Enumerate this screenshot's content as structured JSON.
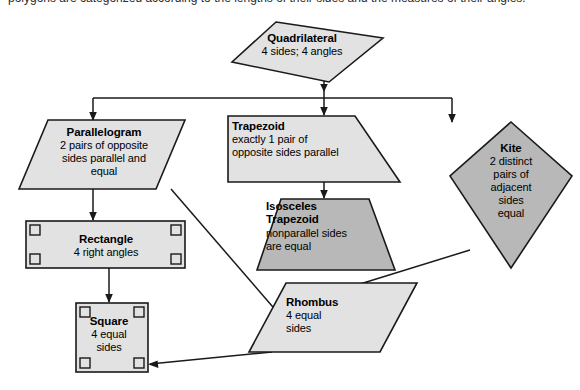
{
  "diagram": {
    "type": "hierarchy-flowchart",
    "title_strip_text": "polygons are categorized according to the lengths of their sides and the measures of their angles.",
    "colors": {
      "fill_light": "#e2e2e2",
      "fill_dark": "#b8b8b8",
      "stroke": "#1a1a1a",
      "background": "#ffffff",
      "text": "#000000"
    },
    "nodes": [
      {
        "id": "quadrilateral",
        "shape": "irregular-quadrilateral",
        "fill": "light",
        "title": "Quadrilateral",
        "sub_lines": [
          "4 sides; 4 angles"
        ]
      },
      {
        "id": "parallelogram",
        "shape": "parallelogram",
        "fill": "light",
        "title": "Parallelogram",
        "sub_lines": [
          "2 pairs of opposite",
          "sides parallel and",
          "equal"
        ]
      },
      {
        "id": "trapezoid",
        "shape": "right-trapezoid",
        "fill": "light",
        "title": "Trapezoid",
        "sub_lines": [
          "exactly 1 pair of",
          "opposite sides parallel"
        ]
      },
      {
        "id": "kite",
        "shape": "kite",
        "fill": "dark",
        "title": "Kite",
        "sub_lines": [
          "2 distinct",
          "pairs of",
          "adjacent",
          "sides",
          "equal"
        ]
      },
      {
        "id": "isosceles-trapezoid",
        "shape": "isosceles-trapezoid",
        "fill": "dark",
        "title": "Isosceles",
        "title2": "Trapezoid",
        "sub_lines": [
          "nonparallel sides",
          "are equal"
        ]
      },
      {
        "id": "rectangle",
        "shape": "rectangle",
        "fill": "light",
        "title": "Rectangle",
        "sub_lines": [
          "4 right angles"
        ],
        "right_angle_marks": 4
      },
      {
        "id": "rhombus",
        "shape": "rhombus",
        "fill": "light",
        "title": "Rhombus",
        "sub_lines": [
          "4 equal",
          "sides"
        ]
      },
      {
        "id": "square",
        "shape": "square",
        "fill": "light",
        "title": "Square",
        "sub_lines": [
          "4 equal",
          "sides"
        ],
        "right_angle_marks": 4
      }
    ],
    "edges": [
      {
        "from": "quadrilateral",
        "to": "bus"
      },
      {
        "from": "bus",
        "to": "parallelogram"
      },
      {
        "from": "bus",
        "to": "trapezoid"
      },
      {
        "from": "bus",
        "to": "kite"
      },
      {
        "from": "trapezoid",
        "to": "isosceles-trapezoid"
      },
      {
        "from": "parallelogram",
        "to": "rectangle"
      },
      {
        "from": "parallelogram",
        "to": "rhombus"
      },
      {
        "from": "kite",
        "to": "rhombus"
      },
      {
        "from": "rectangle",
        "to": "square"
      },
      {
        "from": "rhombus",
        "to": "square"
      }
    ]
  }
}
